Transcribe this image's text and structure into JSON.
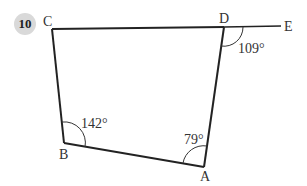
{
  "problem_number": "10",
  "diagram": {
    "vertices": {
      "A": "A",
      "B": "B",
      "C": "C",
      "D": "D",
      "E": "E"
    },
    "angles": {
      "B": "142°",
      "A": "79°",
      "D_exterior": "109°"
    },
    "stroke_color": "#222222"
  }
}
